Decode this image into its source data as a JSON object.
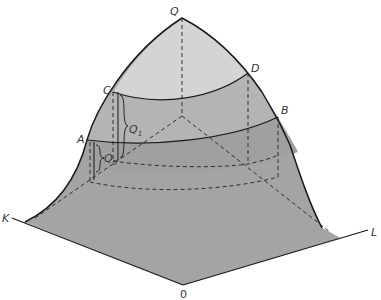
{
  "diagram": {
    "type": "production-surface-3d",
    "colors": {
      "base": "#9a9a9a",
      "lower_band": "#a8a8a8",
      "middle_band": "#bcbcbc",
      "top_cap": "#d6d6d6",
      "outline": "#1a1a1a",
      "dash": "#222222"
    },
    "points": {
      "peak": "Q",
      "C": "C",
      "D": "D",
      "A": "A",
      "B": "B",
      "K_axis": "K",
      "L_axis": "L",
      "origin": "0"
    },
    "isoquants": [
      {
        "label": "Q",
        "subscript": "0"
      },
      {
        "label": "Q",
        "subscript": "1"
      }
    ]
  }
}
